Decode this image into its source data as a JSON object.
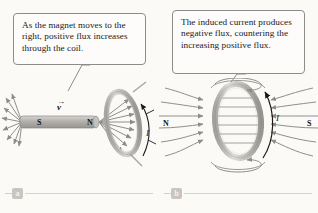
{
  "figure": {
    "background_color": "#fbfaf7",
    "stroke_color": "#8c8c8c",
    "coil_color": "#b8b6b2",
    "magnet_color": "#b5b3af"
  },
  "panels": [
    {
      "id": "a",
      "caption_label": "a",
      "callout_text": "As the magnet moves to the right, positive flux increases through the coil.",
      "diagram": {
        "magnet_south_label": "S",
        "magnet_north_label": "N",
        "velocity_label": "v",
        "velocity_vector_bar": "→",
        "current_label": "I"
      }
    },
    {
      "id": "b",
      "caption_label": "b",
      "callout_text": "The induced current produces negative flux, countering the increasing positive flux.",
      "diagram": {
        "pole_left_label": "N",
        "pole_right_label": "S",
        "current_label": "I"
      }
    }
  ]
}
